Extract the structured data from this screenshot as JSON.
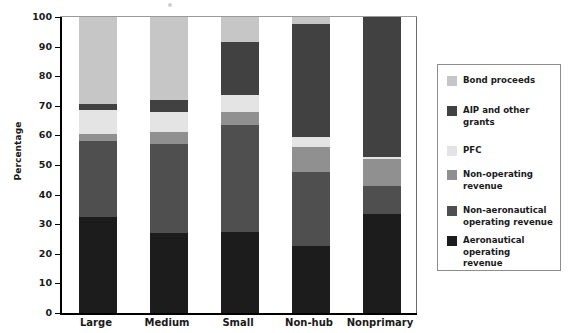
{
  "chart_data": {
    "type": "bar",
    "stacked": true,
    "title": "",
    "xlabel": "",
    "ylabel": "Percentage",
    "ylim": [
      0,
      100
    ],
    "yticks": [
      0,
      10,
      20,
      30,
      40,
      50,
      60,
      70,
      80,
      90,
      100
    ],
    "grid": false,
    "legend_position": "right",
    "categories": [
      "Large",
      "Medium",
      "Small",
      "Non-hub",
      "Nonprimary"
    ],
    "series": [
      {
        "name": "Aeronautical operating revenue",
        "color": "#1c1c1c",
        "values": [
          32.5,
          27,
          27.5,
          22.5,
          33.5
        ]
      },
      {
        "name": "Non-aeronautical operating revenue",
        "color": "#4f4f4f",
        "values": [
          25.5,
          30,
          36,
          25,
          9.5
        ]
      },
      {
        "name": "Non-operating revenue",
        "color": "#909090",
        "values": [
          2.5,
          4,
          4.5,
          8.5,
          9
        ]
      },
      {
        "name": "PFC",
        "color": "#e4e4e4",
        "values": [
          8,
          7,
          5.5,
          3.5,
          0.7
        ]
      },
      {
        "name": "AIP and other grants",
        "color": "#414141",
        "values": [
          2,
          4,
          18,
          38,
          47.3
        ]
      },
      {
        "name": "Bond proceeds",
        "color": "#c6c6c6",
        "values": [
          29.5,
          28,
          8.5,
          2.5,
          0
        ]
      }
    ]
  },
  "legend": {
    "items": [
      {
        "label": "Bond proceeds",
        "color": "#c6c6c6"
      },
      {
        "label": "AIP and other\ngrants",
        "color": "#414141"
      },
      {
        "label": "PFC",
        "color": "#e4e4e4"
      },
      {
        "label": "Non-operating\nrevenue",
        "color": "#909090"
      },
      {
        "label": "Non-aeronautical\noperating revenue",
        "color": "#4f4f4f"
      },
      {
        "label": "Aeronautical\noperating\nrevenue",
        "color": "#1c1c1c"
      }
    ]
  },
  "axis": {
    "y_title": "Percentage"
  }
}
